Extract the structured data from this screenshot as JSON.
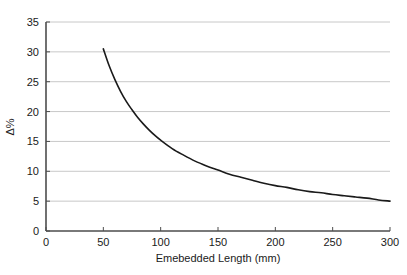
{
  "chart_data": {
    "type": "line",
    "title": "",
    "subtitle": "",
    "xlabel": "Emebedded Length (mm)",
    "ylabel": "Δ%",
    "xlim": [
      0,
      300
    ],
    "ylim": [
      0,
      35
    ],
    "grid": true,
    "grid_axis": "y",
    "legend": false,
    "legend_position": "none",
    "xticks": [
      0,
      50,
      100,
      150,
      200,
      250,
      300
    ],
    "xtick_labels": [
      "0",
      "50",
      "100",
      "150",
      "200",
      "250",
      "300"
    ],
    "yticks": [
      0,
      5,
      10,
      15,
      20,
      25,
      30,
      35
    ],
    "ytick_labels": [
      "0",
      "5",
      "10",
      "15",
      "20",
      "25",
      "30",
      "35"
    ],
    "series": [
      {
        "name": "Delta percent vs embedded length",
        "color": "#1a1a1a",
        "line_width": 1.6,
        "x": [
          50,
          55,
          60,
          65,
          70,
          75,
          80,
          85,
          90,
          95,
          100,
          110,
          120,
          130,
          140,
          150,
          160,
          170,
          180,
          190,
          200,
          210,
          220,
          230,
          240,
          250,
          260,
          270,
          280,
          290,
          300
        ],
        "y": [
          30.5,
          27.7,
          25.4,
          23.4,
          21.7,
          20.3,
          19.0,
          17.9,
          16.9,
          16.0,
          15.2,
          13.8,
          12.7,
          11.7,
          10.9,
          10.2,
          9.5,
          9.0,
          8.5,
          8.0,
          7.6,
          7.3,
          6.9,
          6.6,
          6.4,
          6.1,
          5.9,
          5.7,
          5.5,
          5.2,
          5.0
        ]
      }
    ],
    "axis_color": "#4d4d4d",
    "grid_color": "#c8c8c8",
    "background_color": "#ffffff"
  }
}
